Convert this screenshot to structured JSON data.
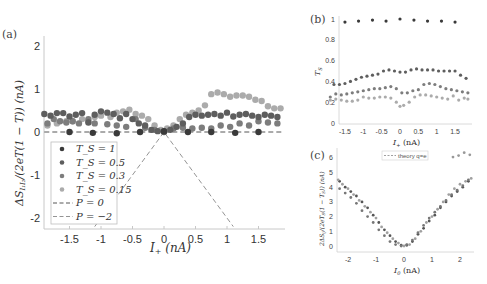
{
  "figure": {
    "panel_labels": [
      "(a)",
      "(b)",
      "(c)"
    ]
  },
  "colors": {
    "Ts_1": "#3a3a3a",
    "Ts_0.5": "#5e5e5e",
    "Ts_0.3": "#7d7d7d",
    "Ts_0.15": "#ababab",
    "axis": "#c8c8c8",
    "dash": "#555555"
  },
  "chart_data": [
    {
      "panel": "(a)",
      "type": "scatter",
      "xlabel": "I_+ (nA)",
      "ylabel": "ΔS_{I₁I₂}/(2eT(1−T)) (nA)",
      "xlim": [
        -1.9,
        1.9
      ],
      "ylim": [
        -2.2,
        2.2
      ],
      "xticks": [
        -1.5,
        -1,
        -0.5,
        0,
        0.5,
        1,
        1.5
      ],
      "yticks": [
        -2,
        -1,
        0,
        1,
        2
      ],
      "grid": false,
      "legend_position": "lower-left inside",
      "legend": [
        "T_S = 1",
        "T_S = 0.5",
        "T_S = 0.3",
        "T_S = 0.15",
        "P = 0",
        "P = −2"
      ],
      "series": [
        {
          "name": "T_S = 1",
          "x": [
            -1.5,
            -1.13,
            -0.75,
            -0.38,
            0.0,
            0.38,
            0.75,
            1.13,
            1.5
          ],
          "y": [
            0.0,
            -0.02,
            -0.03,
            0.0,
            0.02,
            0.0,
            0.0,
            -0.02,
            0.0
          ]
        },
        {
          "name": "T_S = 0.5",
          "x": [
            -1.9,
            -1.8,
            -1.7,
            -1.6,
            -1.5,
            -1.4,
            -1.3,
            -1.2,
            -1.1,
            -1.0,
            -0.9,
            -0.8,
            -0.7,
            -0.6,
            -0.5,
            -0.4,
            -0.3,
            -0.2,
            -0.1,
            0.0,
            0.1,
            0.2,
            0.3,
            0.4,
            0.5,
            0.6,
            0.7,
            0.8,
            0.9,
            1.0,
            1.1,
            1.2,
            1.3,
            1.4,
            1.5,
            1.6,
            1.7,
            1.8
          ],
          "y": [
            0.42,
            0.38,
            0.44,
            0.44,
            0.36,
            0.4,
            0.44,
            0.22,
            0.4,
            0.48,
            0.45,
            0.42,
            0.32,
            0.42,
            0.3,
            0.2,
            0.15,
            0.05,
            0.02,
            0.0,
            0.05,
            0.12,
            0.2,
            0.35,
            0.4,
            0.38,
            0.4,
            0.42,
            0.38,
            0.45,
            0.36,
            0.4,
            0.42,
            0.38,
            0.35,
            0.4,
            0.38,
            0.35
          ]
        },
        {
          "name": "T_S = 0.3",
          "x": [
            -1.85,
            -1.75,
            -1.65,
            -1.55,
            -1.45,
            -1.35,
            -1.2,
            -1.1,
            -0.9,
            -0.75,
            -0.6,
            -0.45,
            -0.3,
            -0.15,
            0.0,
            0.15,
            0.3,
            0.45,
            0.6,
            0.75,
            0.9,
            1.05,
            1.2,
            1.35,
            1.5,
            1.65,
            1.8
          ],
          "y": [
            0.2,
            0.3,
            0.25,
            0.22,
            0.25,
            0.2,
            0.3,
            0.2,
            0.18,
            0.15,
            0.12,
            0.3,
            0.1,
            0.05,
            0.02,
            0.08,
            0.1,
            0.08,
            0.1,
            0.08,
            0.15,
            0.12,
            0.2,
            0.15,
            0.25,
            0.22,
            0.2
          ]
        },
        {
          "name": "T_S = 0.15",
          "x": [
            -1.85,
            -1.7,
            -1.55,
            -1.45,
            -1.3,
            -1.2,
            -1.1,
            -1.0,
            -0.85,
            -0.75,
            -0.65,
            -0.55,
            -0.45,
            -0.35,
            -0.25,
            -0.15,
            -0.05,
            0.05,
            0.15,
            0.25,
            0.35,
            0.45,
            0.55,
            0.65,
            0.75,
            0.85,
            0.95,
            1.05,
            1.15,
            1.25,
            1.35,
            1.45,
            1.55,
            1.65,
            1.75,
            1.85
          ],
          "y": [
            0.15,
            0.2,
            0.25,
            0.25,
            0.3,
            0.25,
            0.35,
            0.38,
            0.35,
            0.45,
            0.48,
            0.52,
            0.42,
            0.38,
            0.3,
            0.15,
            0.05,
            0.08,
            0.15,
            0.3,
            0.4,
            0.45,
            0.5,
            0.62,
            0.88,
            0.92,
            0.88,
            0.82,
            0.85,
            0.85,
            0.82,
            0.75,
            0.72,
            0.6,
            0.55,
            0.55
          ]
        },
        {
          "name": "P = 0",
          "type": "dashed-line",
          "x": [
            -1.9,
            1.9
          ],
          "y": [
            0,
            0
          ]
        },
        {
          "name": "P = −2",
          "type": "dashed-line",
          "x": [
            -1.1,
            0,
            1.1
          ],
          "y": [
            -2.2,
            0,
            -2.2
          ]
        }
      ]
    },
    {
      "panel": "(b)",
      "type": "scatter",
      "xlabel": "I_+ (nA)",
      "ylabel": "T_S",
      "xlim": [
        -1.9,
        1.9
      ],
      "ylim": [
        0,
        1
      ],
      "xticks": [
        -1.5,
        -1,
        -0.5,
        0,
        0.5,
        1,
        1.5
      ],
      "yticks": [
        0,
        0.2,
        0.4,
        0.6,
        0.8,
        1
      ],
      "grid": false,
      "series": [
        {
          "name": "T_S = 1",
          "x": [
            -1.5,
            -1.13,
            -0.75,
            -0.38,
            0.0,
            0.38,
            0.75,
            1.13,
            1.5
          ],
          "y": [
            0.97,
            0.98,
            0.99,
            0.98,
            1.0,
            0.99,
            0.98,
            0.98,
            0.97
          ]
        },
        {
          "name": "T_S = 0.5",
          "x": [
            -1.8,
            -1.65,
            -1.5,
            -1.35,
            -1.2,
            -1.05,
            -0.9,
            -0.75,
            -0.6,
            -0.45,
            -0.3,
            -0.15,
            0.0,
            0.15,
            0.3,
            0.45,
            0.6,
            0.75,
            0.9,
            1.05,
            1.2,
            1.35,
            1.5,
            1.65,
            1.8
          ],
          "y": [
            0.37,
            0.37,
            0.38,
            0.4,
            0.42,
            0.44,
            0.45,
            0.46,
            0.47,
            0.5,
            0.51,
            0.5,
            0.49,
            0.49,
            0.51,
            0.52,
            0.51,
            0.51,
            0.51,
            0.5,
            0.5,
            0.5,
            0.5,
            0.46,
            0.43
          ]
        },
        {
          "name": "T_S = 0.3",
          "x": [
            -1.9,
            -1.75,
            -1.6,
            -1.45,
            -1.3,
            -1.15,
            -1.0,
            -0.85,
            -0.7,
            -0.55,
            -0.4,
            -0.25,
            -0.1,
            0.05,
            0.2,
            0.35,
            0.5,
            0.65,
            0.8,
            0.95,
            1.1,
            1.25,
            1.4,
            1.55,
            1.7,
            1.85
          ],
          "y": [
            0.25,
            0.28,
            0.27,
            0.28,
            0.29,
            0.3,
            0.31,
            0.32,
            0.33,
            0.33,
            0.34,
            0.35,
            0.33,
            0.29,
            0.29,
            0.31,
            0.32,
            0.37,
            0.38,
            0.37,
            0.35,
            0.33,
            0.32,
            0.31,
            0.3,
            0.29
          ]
        },
        {
          "name": "T_S = 0.15",
          "x": [
            -1.9,
            -1.75,
            -1.6,
            -1.45,
            -1.3,
            -1.15,
            -1.0,
            -0.85,
            -0.7,
            -0.55,
            -0.4,
            -0.25,
            -0.1,
            0.0,
            0.1,
            0.25,
            0.4,
            0.55,
            0.7,
            0.85,
            1.0,
            1.15,
            1.3,
            1.45,
            1.6,
            1.75,
            1.85
          ],
          "y": [
            0.22,
            0.23,
            0.22,
            0.21,
            0.21,
            0.22,
            0.25,
            0.24,
            0.24,
            0.25,
            0.25,
            0.24,
            0.2,
            0.16,
            0.17,
            0.2,
            0.25,
            0.27,
            0.27,
            0.26,
            0.25,
            0.24,
            0.23,
            0.26,
            0.22,
            0.24,
            0.23
          ]
        }
      ]
    },
    {
      "panel": "(c)",
      "type": "scatter",
      "xlabel": "I_0 (nA)",
      "ylabel": "2ΔS_{ij}/(2eT_S(1−T_S)) (nA)",
      "xlim": [
        -2.4,
        2.5
      ],
      "ylim": [
        -0.3,
        6.8
      ],
      "xticks": [
        -2,
        -1,
        0,
        1,
        2
      ],
      "yticks": [
        0,
        1,
        2,
        3,
        4,
        5,
        6
      ],
      "grid": false,
      "legend_position": "upper-center inside",
      "legend": [
        "theory q=e"
      ],
      "series": [
        {
          "name": "dark",
          "x": [
            -2.3,
            -2.1,
            -1.9,
            -1.7,
            -1.5,
            -1.3,
            -1.1,
            -0.9,
            -0.7,
            -0.5,
            -0.3,
            -0.1,
            0.1,
            0.3,
            0.5,
            0.7,
            0.9,
            1.1,
            1.3,
            1.5,
            1.7,
            1.9,
            2.1,
            2.3
          ],
          "y": [
            4.4,
            4.0,
            3.7,
            3.4,
            3.0,
            2.6,
            2.1,
            1.6,
            1.1,
            0.7,
            0.3,
            0.05,
            0.05,
            0.3,
            0.8,
            1.2,
            1.7,
            2.1,
            2.6,
            3.0,
            3.4,
            3.7,
            4.0,
            4.4
          ]
        },
        {
          "name": "mid",
          "x": [
            -2.3,
            -2.1,
            -1.9,
            -1.7,
            -1.5,
            -1.3,
            -1.1,
            -0.9,
            -0.7,
            -0.5,
            -0.3,
            -0.1,
            0.1,
            0.3,
            0.5,
            0.7,
            0.9,
            1.1,
            1.3,
            1.5,
            1.7,
            1.9,
            2.1,
            2.3
          ],
          "y": [
            3.9,
            3.6,
            3.3,
            2.9,
            2.4,
            2.0,
            1.6,
            1.1,
            0.7,
            0.3,
            0.1,
            0.0,
            0.1,
            0.4,
            0.9,
            1.4,
            1.9,
            2.3,
            2.7,
            3.1,
            3.5,
            3.8,
            4.1,
            4.5
          ]
        },
        {
          "name": "light",
          "x": [
            -2.35,
            -2.2,
            -2.0,
            -1.8,
            -1.6,
            -1.4,
            -1.2,
            -1.0,
            -0.8,
            -0.6,
            -0.4,
            -0.2,
            0.0,
            0.2,
            0.4,
            0.6,
            0.8,
            1.0,
            1.2,
            1.4,
            1.6,
            1.8,
            2.0,
            2.2,
            2.4
          ],
          "y": [
            4.5,
            4.2,
            3.9,
            3.5,
            3.1,
            2.7,
            2.3,
            1.9,
            1.3,
            0.9,
            0.5,
            0.2,
            0.0,
            0.1,
            0.5,
            1.0,
            1.6,
            2.0,
            2.5,
            3.0,
            3.5,
            3.9,
            4.2,
            4.4,
            4.6
          ]
        },
        {
          "name": "outliers",
          "x": [
            1.75,
            1.95,
            2.15,
            2.35
          ],
          "y": [
            6.05,
            6.15,
            6.35,
            6.2
          ]
        }
      ]
    }
  ]
}
